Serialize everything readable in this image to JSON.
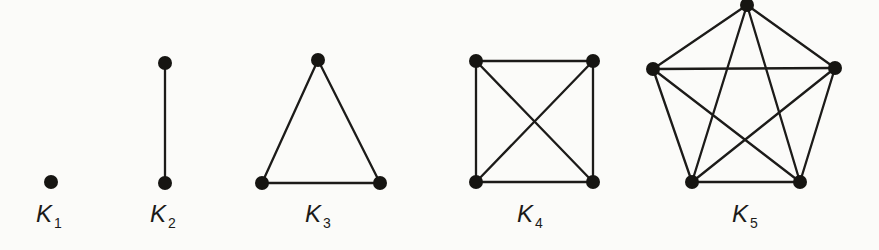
{
  "figure": {
    "background_color": "#fbfbf9",
    "edge_color": "#1c1b19",
    "vertex_color": "#161512",
    "label_color": "#1c1b19",
    "vertex_radius": 7,
    "edge_width": 2.3,
    "graphs": [
      {
        "name": "complete-graph-k1",
        "label_base": "K",
        "label_sub": "1",
        "label_x": 49,
        "label_y": 202,
        "vertices": [
          [
            51,
            182
          ]
        ],
        "edges": []
      },
      {
        "name": "complete-graph-k2",
        "label_base": "K",
        "label_sub": "2",
        "label_x": 163,
        "label_y": 202,
        "vertices": [
          [
            165,
            63
          ],
          [
            165,
            183
          ]
        ],
        "edges": [
          [
            0,
            1
          ]
        ]
      },
      {
        "name": "complete-graph-k3",
        "label_base": "K",
        "label_sub": "3",
        "label_x": 318,
        "label_y": 202,
        "vertices": [
          [
            318,
            60
          ],
          [
            262,
            183
          ],
          [
            380,
            183
          ]
        ],
        "edges": [
          [
            0,
            1
          ],
          [
            0,
            2
          ],
          [
            1,
            2
          ]
        ]
      },
      {
        "name": "complete-graph-k4",
        "label_base": "K",
        "label_sub": "4",
        "label_x": 530,
        "label_y": 202,
        "vertices": [
          [
            476,
            61
          ],
          [
            593,
            61
          ],
          [
            593,
            182
          ],
          [
            476,
            182
          ]
        ],
        "edges": [
          [
            0,
            1
          ],
          [
            1,
            2
          ],
          [
            2,
            3
          ],
          [
            3,
            0
          ],
          [
            0,
            2
          ],
          [
            1,
            3
          ]
        ]
      },
      {
        "name": "complete-graph-k5",
        "label_base": "K",
        "label_sub": "5",
        "label_x": 745,
        "label_y": 202,
        "vertices": [
          [
            747,
            5
          ],
          [
            653,
            69
          ],
          [
            835,
            68
          ],
          [
            800,
            182
          ],
          [
            692,
            182
          ]
        ],
        "edges": [
          [
            0,
            1
          ],
          [
            0,
            2
          ],
          [
            0,
            3
          ],
          [
            0,
            4
          ],
          [
            1,
            2
          ],
          [
            1,
            3
          ],
          [
            1,
            4
          ],
          [
            2,
            3
          ],
          [
            2,
            4
          ],
          [
            3,
            4
          ]
        ]
      }
    ]
  }
}
